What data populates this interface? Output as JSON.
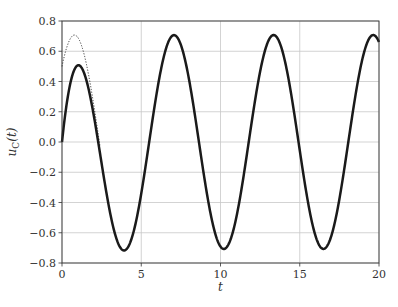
{
  "chart_data": {
    "type": "line",
    "title": "",
    "xlabel": "t",
    "ylabel": "u_C(t)",
    "ylabel_parts": {
      "base": "u",
      "sub": "C",
      "rest": "(t)"
    },
    "xlim": [
      0,
      20
    ],
    "ylim": [
      -0.8,
      0.8
    ],
    "xticks": [
      0,
      5,
      10,
      15,
      20
    ],
    "xtick_labels": [
      "0",
      "5",
      "10",
      "15",
      "20"
    ],
    "yticks": [
      -0.8,
      -0.6,
      -0.4,
      -0.2,
      0.0,
      0.2,
      0.4,
      0.6,
      0.8
    ],
    "ytick_labels": [
      "−0.8",
      "−0.6",
      "−0.4",
      "−0.2",
      "0.0",
      "0.2",
      "0.4",
      "0.6",
      "0.8"
    ],
    "grid": true,
    "legend": null,
    "series": [
      {
        "name": "u_C(t) full response",
        "style": "solid",
        "color": "#1a1a1a",
        "linewidth": 2.5,
        "formula": "0.5*(sin(t)+cos(t)-exp(-t))",
        "t_range": [
          0,
          20
        ],
        "key_points": [
          {
            "t": 0.0,
            "u": 0.0
          },
          {
            "t": 1.1,
            "u": 0.5
          },
          {
            "t": 3.9,
            "u": -0.71
          },
          {
            "t": 7.1,
            "u": 0.71
          },
          {
            "t": 10.2,
            "u": -0.71
          },
          {
            "t": 13.4,
            "u": 0.71
          },
          {
            "t": 16.5,
            "u": -0.71
          },
          {
            "t": 19.6,
            "u": 0.71
          },
          {
            "t": 20.0,
            "u": 0.66
          }
        ]
      },
      {
        "name": "steady-state response",
        "style": "dotted",
        "color": "#1a1a1a",
        "linewidth": 0.9,
        "formula": "0.5*(sin(t)+cos(t))",
        "t_range": [
          0,
          2.4
        ],
        "key_points": [
          {
            "t": 0.0,
            "u": 0.5
          },
          {
            "t": 0.79,
            "u": 0.71
          },
          {
            "t": 2.36,
            "u": 0.0
          }
        ]
      }
    ]
  }
}
